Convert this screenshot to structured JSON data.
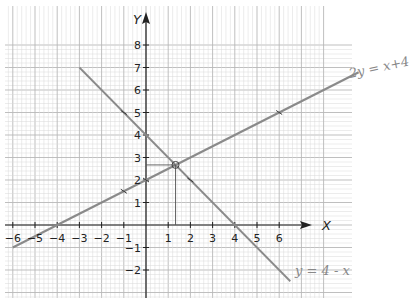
{
  "chart_data": {
    "type": "line",
    "title": "",
    "xlabel": "X",
    "ylabel": "Y",
    "xlim": [
      -6.5,
      8
    ],
    "ylim": [
      -3.3,
      9.8
    ],
    "grid": true,
    "x_ticks": [
      -6,
      -5,
      -4,
      -3,
      -2,
      -1,
      1,
      2,
      3,
      4,
      5,
      6
    ],
    "y_ticks": [
      -2,
      -1,
      1,
      2,
      3,
      4,
      5,
      6,
      7,
      8
    ],
    "series": [
      {
        "name": "2y = x + 4",
        "equation": "y = 0.5x + 2",
        "x": [
          -6,
          6
        ],
        "y": [
          -1,
          5
        ],
        "marked_points": [
          [
            -1,
            1.5
          ],
          [
            0,
            2
          ],
          [
            6,
            5
          ]
        ]
      },
      {
        "name": "y = 4 - x",
        "equation": "y = 4 - x",
        "x": [
          -3,
          6.5
        ],
        "y": [
          7,
          -2.5
        ],
        "marked_points": [
          [
            -1,
            5
          ],
          [
            2,
            2
          ]
        ]
      }
    ],
    "intersection": {
      "x": 1.33,
      "y": 2.67,
      "label": "circled intersection point"
    },
    "annotations": [
      "2y = x + 4",
      "y = 4 - x"
    ]
  },
  "labels": {
    "x_axis": "X",
    "y_axis": "Y",
    "line1": "2y = x+4",
    "line2": "y = 4 - x",
    "x_tick_text": [
      "−6",
      "−5",
      "−4",
      "−3",
      "−2",
      "−1",
      "1",
      "2",
      "3",
      "4",
      "5",
      "6"
    ],
    "y_tick_text": [
      "−2",
      "−1",
      "1",
      "2",
      "3",
      "4",
      "5",
      "6",
      "7",
      "8"
    ]
  },
  "colors": {
    "grid_minor": "#d8d8d8",
    "grid_major": "#b8b8b8",
    "axis": "#222222",
    "line": "#8a8a8a",
    "handwriting": "#8a8a8a"
  }
}
